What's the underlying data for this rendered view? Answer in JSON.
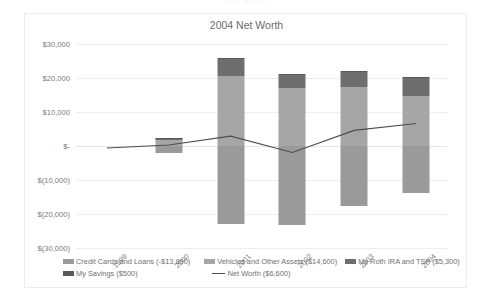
{
  "ghost_caption": "Net Worth",
  "chart_data": {
    "type": "bar",
    "title": "2004 Net Worth",
    "xlabel": "",
    "ylabel": "",
    "ylim": [
      -30000,
      30000
    ],
    "ytick_step": 10000,
    "grid": true,
    "legend_position": "bottom",
    "stacked": true,
    "categories": [
      "1999",
      "2000",
      "2001",
      "2002",
      "2003",
      "2004"
    ],
    "ytick_labels": [
      "$30,000",
      "$20,000",
      "$10,000",
      "$-",
      "$(10,000)",
      "$(20,000)",
      "$(30,000)"
    ],
    "ytick_values": [
      30000,
      20000,
      10000,
      0,
      -10000,
      -20000,
      -30000
    ],
    "series": [
      {
        "name": "Credit Cards and Loans (-$13,800)",
        "key": "credit_cards_and_loans",
        "color": "#9a9a9a",
        "values": [
          0,
          -2200,
          -23000,
          -23200,
          -17500,
          -13800
        ]
      },
      {
        "name": "Vehicles and Other Assets ($14,600)",
        "key": "vehicles_and_other_assets",
        "color": "#a6a6a6",
        "values": [
          0,
          1800,
          20500,
          17200,
          17300,
          14600
        ]
      },
      {
        "name": "My Roth IRA and TSP ($5,300)",
        "key": "my_roth_ira_and_tsp",
        "color": "#6e6e6e",
        "values": [
          0,
          500,
          5000,
          3800,
          4400,
          5300
        ]
      },
      {
        "name": "My Savings ($500)",
        "key": "my_savings",
        "color": "#595959",
        "values": [
          0,
          200,
          400,
          300,
          400,
          500
        ]
      }
    ],
    "line_series": {
      "name": "Net Worth ($6,600)",
      "color": "#4d4d4d",
      "values": [
        -600,
        300,
        2900,
        -1900,
        4600,
        6600
      ]
    },
    "legend": [
      {
        "label": "Credit Cards and Loans (-$13,800)",
        "color": "#9a9a9a",
        "marker": "box"
      },
      {
        "label": "Vehicles and Other Assets ($14,600)",
        "color": "#a6a6a6",
        "marker": "box"
      },
      {
        "label": "My Roth IRA and TSP ($5,300)",
        "color": "#6e6e6e",
        "marker": "box"
      },
      {
        "label": "My Savings ($500)",
        "color": "#595959",
        "marker": "box"
      },
      {
        "label": "Net Worth ($6,600)",
        "color": "#4d4d4d",
        "marker": "line"
      }
    ]
  }
}
